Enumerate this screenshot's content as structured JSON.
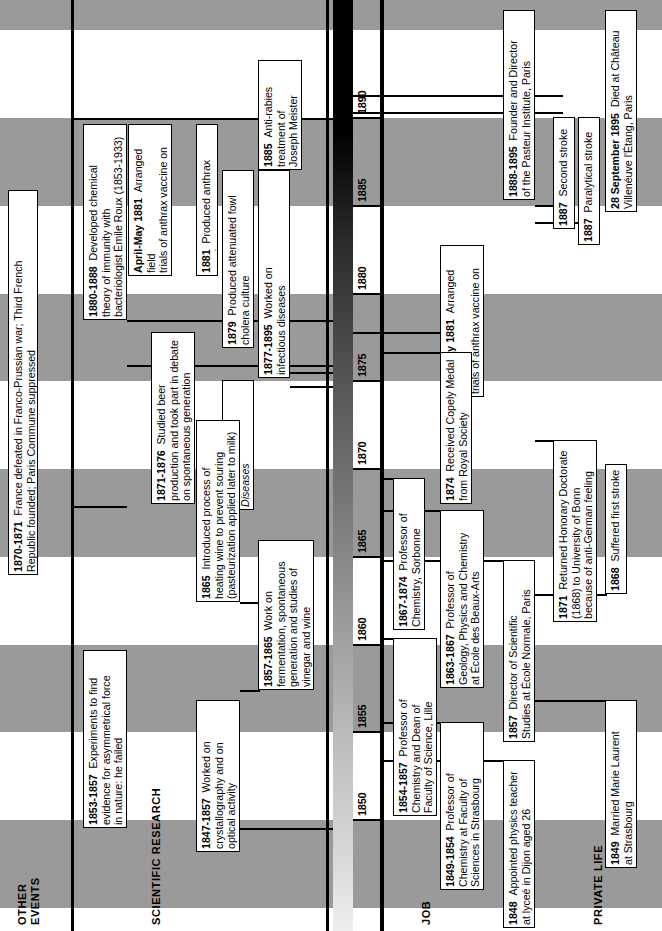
{
  "figure": {
    "orientation": "rotated-90-ccw",
    "axis": {
      "min_year": 1847,
      "max_year": 1896,
      "tick_years": [
        1850,
        1855,
        1860,
        1865,
        1870,
        1875,
        1880,
        1885,
        1890
      ],
      "tick_labels": [
        "1850",
        "1855",
        "1860",
        "1865",
        "1870",
        "1875",
        "1880",
        "1885",
        "1890"
      ],
      "band_interval_years": 5,
      "band_color": "#9a9a9a",
      "strip_light_color": "#d8d8d8",
      "strip_dark_color": "#000000"
    }
  },
  "lanes": [
    {
      "id": "other-events",
      "label": "OTHER\nEVENTS"
    },
    {
      "id": "scientific-research",
      "label": "SCIENTIFIC RESEARCH"
    },
    {
      "id": "job",
      "label": "JOB"
    },
    {
      "id": "private-life",
      "label": "PRIVATE LIFE"
    }
  ],
  "events": [
    {
      "lane": "other-events",
      "year": "1870-1871",
      "bold_year": true,
      "text": "France defeated in Franco-Prussian war; Third French\nRepublic founded; Paris Commune suppressed",
      "start_year": 1870,
      "end_year": 1871
    },
    {
      "lane": "scientific-research",
      "year": "1880-1888",
      "bold_year": true,
      "text": "Developed chemical\ntheory of immunity with\nbacteriologist Émile Roux (1853-1933)",
      "start_year": 1880,
      "end_year": 1888
    },
    {
      "lane": "scientific-research",
      "year": "April-May 1881",
      "bold_year": true,
      "text": "Arranged field\ntrials of anthrax vaccine on farm\nat Pouilly-le-fort",
      "start_year": 1881,
      "end_year": 1881
    },
    {
      "lane": "scientific-research",
      "year": "1881",
      "bold_year": true,
      "text": "Produced anthrax vaccine",
      "start_year": 1881,
      "end_year": 1881
    },
    {
      "lane": "scientific-research",
      "year": "1879",
      "bold_year": true,
      "text": "Produced attenuated fowl\ncholera culture",
      "start_year": 1879,
      "end_year": 1879
    },
    {
      "lane": "scientific-research",
      "year": "1877-1895",
      "bold_year": true,
      "text": "Worked on\ninfectious diseases",
      "start_year": 1877,
      "end_year": 1895
    },
    {
      "lane": "scientific-research",
      "year": "1885",
      "bold_year": true,
      "text": "Anti-rabies\ntreatment of\nJoseph Meister",
      "start_year": 1885,
      "end_year": 1885
    },
    {
      "lane": "scientific-research",
      "year": "1871-1876",
      "bold_year": true,
      "text": "Studied beer\nproduction and took part in debate\non spontaneous generation",
      "start_year": 1871,
      "end_year": 1876
    },
    {
      "lane": "scientific-research",
      "year": "1870",
      "bold_year": true,
      "italic_body": true,
      "text": "Studies on Diseases\nof Silkworms",
      "start_year": 1870,
      "end_year": 1870
    },
    {
      "lane": "scientific-research",
      "year": "1865",
      "bold_year": true,
      "text": "Introduced process of\nheating wine to prevent souring\n(pasteurization applied later to milk)",
      "start_year": 1865,
      "end_year": 1865
    },
    {
      "lane": "scientific-research",
      "year": "1857-1865",
      "bold_year": true,
      "text": "Work on\nfermentation, spontaneous\ngeneration and studies of\nvinegar and wine",
      "start_year": 1857,
      "end_year": 1865
    },
    {
      "lane": "scientific-research",
      "year": "1853-1857",
      "bold_year": true,
      "text": "Experiments to find\nevidence for asymmetrical force\nin nature: he failed",
      "start_year": 1853,
      "end_year": 1857
    },
    {
      "lane": "scientific-research",
      "year": "1847-1857",
      "bold_year": true,
      "text": "Worked on\ncrystallography and on\noptical activity",
      "start_year": 1847,
      "end_year": 1857
    },
    {
      "lane": "job",
      "year": "1888-1895",
      "bold_year": true,
      "text": "Founder and Director\nof the Pasteur Institute, Paris",
      "start_year": 1888,
      "end_year": 1895
    },
    {
      "lane": "job",
      "year": "April-May 1881",
      "bold_year": true,
      "text": "Arranged field\ntrials of anthrax vaccine on farm\nat Pouilly-le-fort",
      "start_year": 1881,
      "end_year": 1881
    },
    {
      "lane": "job",
      "year": "1874",
      "bold_year": true,
      "text": "Received Copely Medal\nfrom Royal Society",
      "start_year": 1874,
      "end_year": 1874
    },
    {
      "lane": "job",
      "year": "1867-1874",
      "bold_year": true,
      "text": "Professor of\nChemistry, Sorbonne",
      "start_year": 1867,
      "end_year": 1874
    },
    {
      "lane": "job",
      "year": "1863-1867",
      "bold_year": true,
      "text": "Professor of\nGeology, Physics and Chemistry\nat École des Beaux-Arts",
      "start_year": 1863,
      "end_year": 1867
    },
    {
      "lane": "job",
      "year": "1857",
      "bold_year": true,
      "text": "Director of Scientific\nStudies at École Normale, Paris",
      "start_year": 1857,
      "end_year": 1857
    },
    {
      "lane": "job",
      "year": "1854-1857",
      "bold_year": true,
      "text": "Professor of\nChemistry and Dean of\nFaculty of Science, Lille",
      "start_year": 1854,
      "end_year": 1857
    },
    {
      "lane": "job",
      "year": "1849-1854",
      "bold_year": true,
      "text": "Professor of\nChemistry at Faculty of\nSciences in Strasbourg",
      "start_year": 1849,
      "end_year": 1854
    },
    {
      "lane": "job",
      "year": "1848",
      "bold_year": true,
      "text": "Appointed physics teacher\nat lyceé in Dijon aged 26",
      "start_year": 1848,
      "end_year": 1848
    },
    {
      "lane": "private-life",
      "year": "1887",
      "bold_year": true,
      "text": "Second stroke",
      "start_year": 1887,
      "end_year": 1887
    },
    {
      "lane": "private-life",
      "year": "1887",
      "bold_year": true,
      "text": "Paralytical stroke",
      "start_year": 1887,
      "end_year": 1887
    },
    {
      "lane": "private-life",
      "year": "28 September 1895",
      "bold_year": true,
      "text": "Died at Château\nVillenéuve l'Étang, Paris",
      "start_year": 1895,
      "end_year": 1895
    },
    {
      "lane": "private-life",
      "year": "1871",
      "bold_year": true,
      "text": "Returned Honorary Doctorate\n(1868) to University of Bonn\nbecause of anti-German feeling",
      "start_year": 1871,
      "end_year": 1871
    },
    {
      "lane": "private-life",
      "year": "1868",
      "bold_year": true,
      "text": "Suffered first stroke",
      "start_year": 1868,
      "end_year": 1868
    },
    {
      "lane": "private-life",
      "year": "1849",
      "bold_year": true,
      "text": "Married Marie Laurent\nat Strasbourg",
      "start_year": 1849,
      "end_year": 1849
    }
  ],
  "geometry": {
    "note": "x=left offset px of box in rotated page; w=box thickness px; y/h from year scale",
    "year_to_y": {
      "y_at_1850": 820,
      "px_per_year": 17.55
    },
    "boxes": [
      {
        "k": "oe-1870",
        "x": 8,
        "w": 30,
        "y": 190,
        "h": 385
      },
      {
        "k": "sr-1880",
        "x": 83,
        "w": 44,
        "y": 124,
        "h": 196
      },
      {
        "k": "sr-apr81",
        "x": 128,
        "w": 44,
        "y": 124,
        "h": 152
      },
      {
        "k": "sr-1881",
        "x": 196,
        "w": 22,
        "y": 124,
        "h": 152
      },
      {
        "k": "sr-1879",
        "x": 222,
        "w": 32,
        "y": 170,
        "h": 178
      },
      {
        "k": "sr-1877",
        "x": 258,
        "w": 32,
        "y": 170,
        "h": 208
      },
      {
        "k": "sr-1885",
        "x": 258,
        "w": 44,
        "y": 60,
        "h": 110
      },
      {
        "k": "sr-1871",
        "x": 151,
        "w": 44,
        "y": 332,
        "h": 172
      },
      {
        "k": "sr-1870i",
        "x": 222,
        "w": 32,
        "y": 380,
        "h": 130
      },
      {
        "k": "sr-1865",
        "x": 196,
        "w": 44,
        "y": 420,
        "h": 182
      },
      {
        "k": "sr-1857",
        "x": 258,
        "w": 56,
        "y": 540,
        "h": 150
      },
      {
        "k": "sr-1853",
        "x": 83,
        "w": 44,
        "y": 650,
        "h": 178
      },
      {
        "k": "sr-1847",
        "x": 196,
        "w": 44,
        "y": 700,
        "h": 152
      },
      {
        "k": "job-1888",
        "x": 503,
        "w": 32,
        "y": 10,
        "h": 190
      },
      {
        "k": "job-a81",
        "x": 440,
        "w": 44,
        "y": 245,
        "h": 152
      },
      {
        "k": "job-1874",
        "x": 440,
        "w": 32,
        "y": 352,
        "h": 152
      },
      {
        "k": "job-1867",
        "x": 393,
        "w": 32,
        "y": 478,
        "h": 152
      },
      {
        "k": "job-1863",
        "x": 440,
        "w": 44,
        "y": 510,
        "h": 178
      },
      {
        "k": "job-1857",
        "x": 503,
        "w": 32,
        "y": 560,
        "h": 182
      },
      {
        "k": "job-1854",
        "x": 393,
        "w": 44,
        "y": 638,
        "h": 178
      },
      {
        "k": "job-1849",
        "x": 440,
        "w": 44,
        "y": 722,
        "h": 168
      },
      {
        "k": "job-1848",
        "x": 503,
        "w": 32,
        "y": 760,
        "h": 168
      },
      {
        "k": "pl-1887a",
        "x": 553,
        "w": 22,
        "y": 117,
        "h": 112
      },
      {
        "k": "pl-1887b",
        "x": 578,
        "w": 22,
        "y": 117,
        "h": 128
      },
      {
        "k": "pl-1895",
        "x": 605,
        "w": 32,
        "y": 10,
        "h": 202
      },
      {
        "k": "pl-1871",
        "x": 553,
        "w": 44,
        "y": 440,
        "h": 182
      },
      {
        "k": "pl-1868",
        "x": 605,
        "w": 22,
        "y": 464,
        "h": 130
      },
      {
        "k": "pl-1849",
        "x": 605,
        "w": 32,
        "y": 700,
        "h": 168
      }
    ]
  }
}
